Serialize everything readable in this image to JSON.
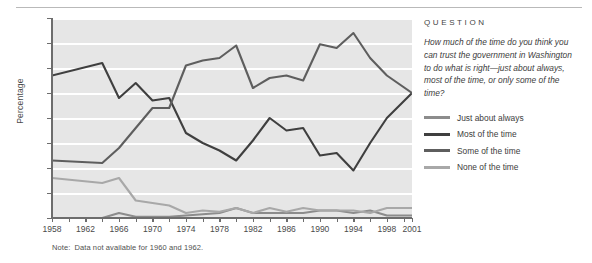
{
  "note": {
    "label": "Note:",
    "text": "Data not available for 1960 and 1962."
  },
  "question": {
    "heading": "QUESTION",
    "text": "How much of the time do you think you can trust the government in Washington to do what is right—just about always, most of the time, or only some of the time?"
  },
  "legend": [
    {
      "label": "Just about always",
      "color": "#8c8c8c"
    },
    {
      "label": "Most of the time",
      "color": "#3f3f3f"
    },
    {
      "label": "Some of the time",
      "color": "#5e5e5e"
    },
    {
      "label": "None of the time",
      "color": "#a8a8a8"
    }
  ],
  "chart_data": {
    "type": "line",
    "title": "",
    "xlabel": "",
    "ylabel": "Percentage",
    "ylim": [
      0,
      80
    ],
    "yticks": [
      0,
      10,
      20,
      30,
      40,
      50,
      60,
      70,
      80
    ],
    "ytick_labels": [
      "",
      "10",
      "20",
      "30",
      "40",
      "50",
      "60",
      "70",
      "80"
    ],
    "xlim": [
      1958,
      2001
    ],
    "xtick_labels": [
      "1958",
      "1962",
      "1966",
      "1970",
      "1974",
      "1978",
      "1982",
      "1986",
      "1990",
      "1994",
      "1998",
      "2001"
    ],
    "xtick_values": [
      1958,
      1962,
      1966,
      1970,
      1974,
      1978,
      1982,
      1986,
      1990,
      1994,
      1998,
      2001
    ],
    "minor_xticks": [
      1960,
      1964,
      1968,
      1972,
      1976,
      1980,
      1984,
      1988,
      1992,
      1996,
      2000
    ],
    "grid": "horizontal-white",
    "legend_position": "right",
    "x": [
      1958,
      1964,
      1966,
      1968,
      1970,
      1972,
      1974,
      1976,
      1978,
      1980,
      1982,
      1984,
      1986,
      1988,
      1990,
      1992,
      1994,
      1996,
      1998,
      2001
    ],
    "series": [
      {
        "name": "Just about always",
        "color": "#8c8c8c",
        "values": [
          0,
          0,
          2,
          0.5,
          0.5,
          0.5,
          1,
          1.5,
          2,
          4,
          2,
          2,
          2,
          2,
          3,
          3,
          2,
          3,
          1,
          1
        ]
      },
      {
        "name": "Most of the time",
        "color": "#3f3f3f",
        "values": [
          57,
          62,
          48,
          54,
          47,
          48,
          34,
          30,
          27,
          23,
          31,
          40,
          35,
          36,
          25,
          26,
          19,
          30,
          40,
          50
        ]
      },
      {
        "name": "Some of the time",
        "color": "#5e5e5e",
        "values": [
          23,
          22,
          28,
          36,
          44,
          44,
          61,
          63,
          64,
          69,
          52,
          56,
          57,
          55,
          69.5,
          68,
          74,
          64,
          57,
          50
        ]
      },
      {
        "name": "None of the time",
        "color": "#a8a8a8",
        "values": [
          16,
          14,
          16,
          7,
          6,
          5,
          2,
          3,
          2.5,
          4,
          2,
          4,
          2.5,
          4,
          3,
          3,
          3,
          2,
          4,
          4
        ]
      }
    ]
  }
}
